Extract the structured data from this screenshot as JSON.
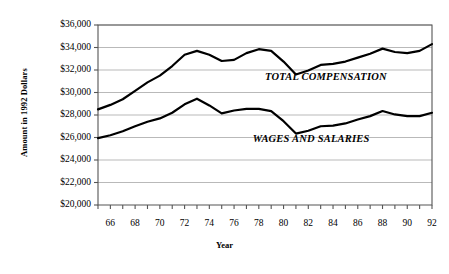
{
  "chart_data": {
    "type": "line",
    "title": "",
    "xlabel": "Year",
    "ylabel": "Amount in 1992 Dollars",
    "xlim": [
      65,
      92
    ],
    "ylim": [
      20000,
      36000
    ],
    "grid": true,
    "legend_position": "inline-annotation",
    "y_tick_labels": [
      "$20,000",
      "$22,000",
      "$24,000",
      "$26,000",
      "$28,000",
      "$30,000",
      "$32,000",
      "$34,000",
      "$36,000"
    ],
    "y_tick_values": [
      20000,
      22000,
      24000,
      26000,
      28000,
      30000,
      32000,
      34000,
      36000
    ],
    "x_tick_labels": [
      "66",
      "68",
      "70",
      "72",
      "74",
      "76",
      "78",
      "80",
      "82",
      "84",
      "86",
      "88",
      "90",
      "92"
    ],
    "x_tick_values": [
      66,
      68,
      70,
      72,
      74,
      76,
      78,
      80,
      82,
      84,
      86,
      88,
      90,
      92
    ],
    "x_minor_ticks": [
      65,
      66,
      67,
      68,
      69,
      70,
      71,
      72,
      73,
      74,
      75,
      76,
      77,
      78,
      79,
      80,
      81,
      82,
      83,
      84,
      85,
      86,
      87,
      88,
      89,
      90,
      91,
      92
    ],
    "x": [
      65,
      66,
      67,
      68,
      69,
      70,
      71,
      72,
      73,
      74,
      75,
      76,
      77,
      78,
      79,
      80,
      81,
      82,
      83,
      84,
      85,
      86,
      87,
      88,
      89,
      90,
      91,
      92
    ],
    "series": [
      {
        "name": "TOTAL COMPENSATION",
        "color": "#000000",
        "values": [
          28500,
          28900,
          29400,
          30150,
          30900,
          31500,
          32350,
          33350,
          33700,
          33350,
          32800,
          32900,
          33500,
          33850,
          33700,
          32750,
          31600,
          31950,
          32450,
          32550,
          32750,
          33100,
          33450,
          33900,
          33600,
          33500,
          33700,
          34300
        ]
      },
      {
        "name": "WAGES AND SALARIES",
        "color": "#000000",
        "values": [
          25950,
          26200,
          26550,
          27000,
          27400,
          27700,
          28200,
          28950,
          29450,
          28850,
          28150,
          28400,
          28550,
          28550,
          28350,
          27450,
          26350,
          26600,
          27000,
          27050,
          27250,
          27600,
          27900,
          28350,
          28050,
          27900,
          27900,
          28200
        ]
      }
    ],
    "annotations": [
      {
        "text": "TOTAL COMPENSATION",
        "x": 78.5,
        "y": 31300
      },
      {
        "text": "WAGES AND SALARIES",
        "x": 77.5,
        "y": 25800
      }
    ],
    "colors": {
      "line": "#000000",
      "gridline": "#b9b9b9",
      "frame": "#555555",
      "background": "#ffffff",
      "text": "#000000"
    }
  }
}
